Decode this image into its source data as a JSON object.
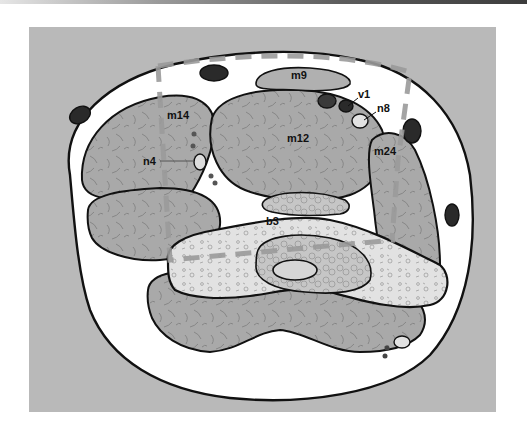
{
  "figure": {
    "type": "anatomical cross-section",
    "labels": [
      {
        "id": "m9",
        "text": "m9",
        "x": 291,
        "y": 76
      },
      {
        "id": "v1",
        "text": "v1",
        "x": 360,
        "y": 99
      },
      {
        "id": "n8",
        "text": "n8",
        "x": 378,
        "y": 113
      },
      {
        "id": "m14",
        "text": "m14",
        "x": 167,
        "y": 117
      },
      {
        "id": "m12",
        "text": "m12",
        "x": 287,
        "y": 140
      },
      {
        "id": "m24",
        "text": "m24",
        "x": 374,
        "y": 153
      },
      {
        "id": "n4",
        "text": "n4",
        "x": 144,
        "y": 164
      },
      {
        "id": "b3",
        "text": "b3",
        "x": 266,
        "y": 224
      }
    ]
  },
  "colors": {
    "background": "#ffffff",
    "panel": "#b9b9b9",
    "skin": "#ffffff",
    "muscle": "#a9a9a9",
    "bone": "#e4e4e4",
    "marrow": "#c9c9c9",
    "vessel": "#2a2a2a",
    "outline": "#111111",
    "dashed_overlay": "#9a9a9a"
  }
}
